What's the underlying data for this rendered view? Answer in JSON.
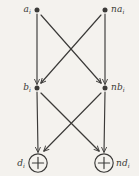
{
  "figure": {
    "type": "signal-flow-butterfly-diagram",
    "background_color": "#f4f2ee",
    "ink_color": "#3b3a38",
    "width": 139,
    "height": 176
  },
  "nodes": [
    {
      "id": "a",
      "label_main": "a",
      "label_sub": "i",
      "shape": "dot",
      "x": 37,
      "y": 10,
      "label_side": "left",
      "row": "top"
    },
    {
      "id": "na",
      "label_main": "na",
      "label_sub": "i",
      "shape": "dot",
      "x": 105,
      "y": 10,
      "label_side": "right",
      "row": "top"
    },
    {
      "id": "b",
      "label_main": "b",
      "label_sub": "i",
      "shape": "dot",
      "x": 37,
      "y": 88,
      "label_side": "left",
      "row": "middle"
    },
    {
      "id": "nb",
      "label_main": "nb",
      "label_sub": "i",
      "shape": "dot",
      "x": 105,
      "y": 88,
      "label_side": "right",
      "row": "middle"
    },
    {
      "id": "d",
      "label_main": "d",
      "label_sub": "i",
      "shape": "circled-plus",
      "x": 38,
      "y": 163,
      "label_side": "left",
      "row": "bottom"
    },
    {
      "id": "nd",
      "label_main": "nd",
      "label_sub": "i",
      "shape": "circled-plus",
      "x": 104,
      "y": 163,
      "label_side": "right",
      "row": "bottom"
    }
  ],
  "edges": [
    {
      "id": "a-to-b",
      "from": "a",
      "to": "b",
      "kind": "vertical"
    },
    {
      "id": "na-to-nb",
      "from": "na",
      "to": "nb",
      "kind": "vertical"
    },
    {
      "id": "a-to-nb",
      "from": "a",
      "to": "nb",
      "kind": "diagonal"
    },
    {
      "id": "na-to-b",
      "from": "na",
      "to": "b",
      "kind": "diagonal"
    },
    {
      "id": "b-to-d",
      "from": "b",
      "to": "d",
      "kind": "vertical"
    },
    {
      "id": "nb-to-nd",
      "from": "nb",
      "to": "nd",
      "kind": "vertical"
    },
    {
      "id": "b-to-nd",
      "from": "b",
      "to": "nd",
      "kind": "diagonal"
    },
    {
      "id": "nb-to-d",
      "from": "nb",
      "to": "d",
      "kind": "diagonal"
    }
  ],
  "symbols": {
    "adder": "plus",
    "node_dot": "filled-dot",
    "arrowhead": "open-v"
  }
}
